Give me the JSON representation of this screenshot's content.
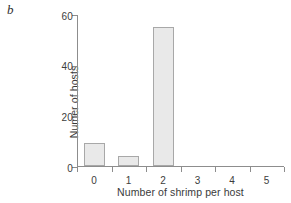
{
  "panel": {
    "label": "b"
  },
  "chart_data": {
    "type": "bar",
    "title": "",
    "subtitle": "",
    "categories": [
      "0",
      "1",
      "2",
      "3",
      "4",
      "5"
    ],
    "values": [
      9,
      4,
      55,
      0,
      0,
      0
    ],
    "series": [
      {
        "name": "Number of hosts",
        "values": [
          9,
          4,
          55,
          0,
          0,
          0
        ]
      }
    ],
    "xlabel": "Number of shrimp per host",
    "ylabel": "Numer of hosts",
    "xlim": [
      -0.5,
      5.5
    ],
    "ylim": [
      0,
      60
    ],
    "yticks": [
      0,
      20,
      40,
      60
    ],
    "ytick_labels": [
      "0",
      "20",
      "40",
      "60"
    ],
    "xticks": [
      0,
      1,
      2,
      3,
      4,
      5
    ],
    "xtick_labels": [
      "0",
      "1",
      "2",
      "3",
      "4",
      "5"
    ],
    "grid": false,
    "legend": false,
    "legend_position": "none",
    "bar_fill_color": "#e9e9e9",
    "bar_edge_color": "#a8a8a8",
    "axis_color": "#8d8d8d",
    "text_color": "#3a3a3a",
    "background_color": "#ffffff"
  }
}
